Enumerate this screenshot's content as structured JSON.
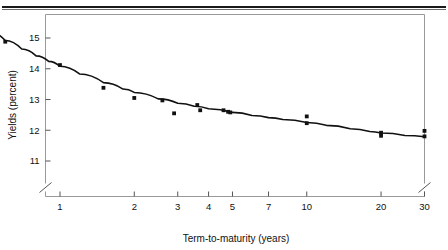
{
  "chart_data": {
    "type": "scatter",
    "title": "",
    "xlabel": "Term-to-maturity (years)",
    "ylabel": "Yields (percent)",
    "xscale": "log",
    "yscale": "linear",
    "xlim": [
      0.5,
      30
    ],
    "ylim": [
      10.55,
      15.5
    ],
    "grid": false,
    "legend": null,
    "axis_break": {
      "axis": "y",
      "below_value": 11,
      "note": "break mark on both vertical axes below the 11 tick"
    },
    "xticks": [
      {
        "value": 1,
        "label": "1"
      },
      {
        "value": 2,
        "label": "2"
      },
      {
        "value": 3,
        "label": "3"
      },
      {
        "value": 4,
        "label": "4"
      },
      {
        "value": 5,
        "label": "5"
      },
      {
        "value": 7,
        "label": "7"
      },
      {
        "value": 10,
        "label": "10"
      },
      {
        "value": 20,
        "label": "20"
      },
      {
        "value": 30,
        "label": "30"
      }
    ],
    "yticks": [
      {
        "value": 11,
        "label": "11"
      },
      {
        "value": 12,
        "label": "12"
      },
      {
        "value": 13,
        "label": "13"
      },
      {
        "value": 14,
        "label": "14"
      },
      {
        "value": 15,
        "label": "15"
      }
    ],
    "points": [
      {
        "x": 0.5,
        "y": 15.22
      },
      {
        "x": 0.5,
        "y": 15.08
      },
      {
        "x": 0.55,
        "y": 15.12
      },
      {
        "x": 0.6,
        "y": 14.88
      },
      {
        "x": 1.0,
        "y": 14.12
      },
      {
        "x": 1.5,
        "y": 13.38
      },
      {
        "x": 2.0,
        "y": 13.05
      },
      {
        "x": 2.6,
        "y": 12.97
      },
      {
        "x": 2.9,
        "y": 12.55
      },
      {
        "x": 3.6,
        "y": 12.82
      },
      {
        "x": 3.7,
        "y": 12.65
      },
      {
        "x": 4.6,
        "y": 12.65
      },
      {
        "x": 4.8,
        "y": 12.6
      },
      {
        "x": 4.9,
        "y": 12.58
      },
      {
        "x": 10.0,
        "y": 12.45
      },
      {
        "x": 10.0,
        "y": 12.23
      },
      {
        "x": 20.0,
        "y": 11.92
      },
      {
        "x": 20.0,
        "y": 11.82
      },
      {
        "x": 30.0,
        "y": 11.98
      },
      {
        "x": 30.0,
        "y": 11.8
      }
    ],
    "fit_curve": {
      "description": "smooth decaying fitted yield curve through the scatter",
      "points": [
        {
          "x": 0.5,
          "y": 15.25
        },
        {
          "x": 0.6,
          "y": 14.92
        },
        {
          "x": 0.7,
          "y": 14.64
        },
        {
          "x": 0.8,
          "y": 14.42
        },
        {
          "x": 0.9,
          "y": 14.24
        },
        {
          "x": 1.0,
          "y": 14.08
        },
        {
          "x": 1.2,
          "y": 13.83
        },
        {
          "x": 1.5,
          "y": 13.55
        },
        {
          "x": 1.8,
          "y": 13.34
        },
        {
          "x": 2.0,
          "y": 13.23
        },
        {
          "x": 2.5,
          "y": 13.02
        },
        {
          "x": 3.0,
          "y": 12.88
        },
        {
          "x": 3.5,
          "y": 12.78
        },
        {
          "x": 4.0,
          "y": 12.7
        },
        {
          "x": 5.0,
          "y": 12.58
        },
        {
          "x": 6.0,
          "y": 12.48
        },
        {
          "x": 7.0,
          "y": 12.41
        },
        {
          "x": 8.0,
          "y": 12.35
        },
        {
          "x": 10.0,
          "y": 12.25
        },
        {
          "x": 12.0,
          "y": 12.16
        },
        {
          "x": 15.0,
          "y": 12.05
        },
        {
          "x": 18.0,
          "y": 11.96
        },
        {
          "x": 20.0,
          "y": 11.91
        },
        {
          "x": 25.0,
          "y": 11.83
        },
        {
          "x": 30.0,
          "y": 11.79
        }
      ]
    },
    "colors": {
      "marker": "#111111",
      "curve": "#111111",
      "axis": "#555555",
      "frame": "#888888",
      "rule": "#1a1a1a"
    }
  }
}
